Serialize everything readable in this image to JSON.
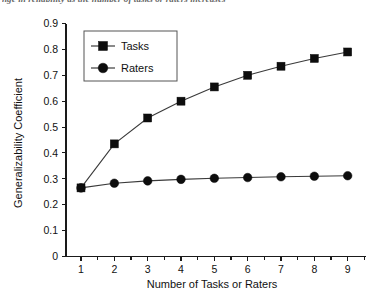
{
  "caption": {
    "text": "nge in reliability as the number of tasks or raters increases"
  },
  "chart_data": {
    "type": "line",
    "title": "",
    "xlabel": "Number of Tasks or Raters",
    "ylabel": "Generalizability Coefficient",
    "x": [
      1,
      2,
      3,
      4,
      5,
      6,
      7,
      8,
      9
    ],
    "xlim": [
      0.55,
      9.55
    ],
    "ylim": [
      0,
      0.9
    ],
    "xticks": [
      1,
      2,
      3,
      4,
      5,
      6,
      7,
      8,
      9
    ],
    "xticklabels": [
      "1",
      "2",
      "3",
      "4",
      "5",
      "6",
      "7",
      "8",
      "9"
    ],
    "yticks": [
      0,
      0.1,
      0.2,
      0.3,
      0.4,
      0.5,
      0.6,
      0.7,
      0.8,
      0.9
    ],
    "yticklabels": [
      "0",
      "0.1",
      "0.2",
      "0.3",
      "0.4",
      "0.5",
      "0.6",
      "0.7",
      "0.8",
      "0.9"
    ],
    "grid": false,
    "legend_position": "upper left",
    "series": [
      {
        "name": "Tasks",
        "marker": "square",
        "color": "#0d0d0d",
        "values": [
          0.265,
          0.435,
          0.535,
          0.6,
          0.655,
          0.7,
          0.735,
          0.765,
          0.79
        ]
      },
      {
        "name": "Raters",
        "marker": "circle",
        "color": "#0d0d0d",
        "values": [
          0.265,
          0.283,
          0.292,
          0.298,
          0.302,
          0.305,
          0.308,
          0.31,
          0.312
        ]
      }
    ],
    "legend": [
      "Tasks",
      "Raters"
    ]
  }
}
